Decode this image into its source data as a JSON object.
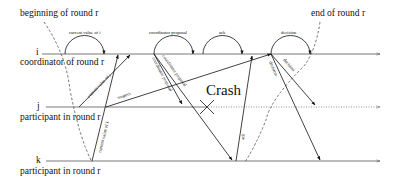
{
  "diagram": {
    "type": "message-sequence",
    "colors": {
      "line": "#222222",
      "timeline": "#555555",
      "background": "#ffffff"
    },
    "annotations": {
      "beginning": "beginning of round r",
      "end": "end of round r",
      "crash": "Crash"
    },
    "processes": [
      {
        "id": "i",
        "name": "i",
        "role": "coordinator of round r"
      },
      {
        "id": "j",
        "name": "j",
        "role": "participant in round r"
      },
      {
        "id": "k",
        "name": "k",
        "role": "participant in round r"
      }
    ],
    "phases": [
      {
        "label": "current value of i"
      },
      {
        "label": "coordinator proposal"
      },
      {
        "label": "ack"
      },
      {
        "label": "decision"
      }
    ],
    "messages": [
      {
        "from": "j",
        "to": "i",
        "label": "current value of j"
      },
      {
        "from": "k",
        "to": "i",
        "label": "current value of k"
      },
      {
        "from": "j",
        "to": "i",
        "label": "suspect"
      },
      {
        "from": "i",
        "to": "j",
        "label": "coordinator proposal"
      },
      {
        "from": "i",
        "to": "k",
        "label": "coordinator proposal"
      },
      {
        "from": "k",
        "to": "i",
        "label": "ack"
      },
      {
        "from": "i",
        "to": "j",
        "label": "decision"
      },
      {
        "from": "i",
        "to": "k",
        "label": "decision"
      }
    ]
  }
}
